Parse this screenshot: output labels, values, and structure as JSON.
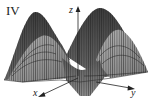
{
  "figure": {
    "panel_label": "IV",
    "type": "3d-surface-plot",
    "axes": {
      "z_label": "z",
      "x_label": "x",
      "y_label": "y"
    },
    "colors": {
      "background": "#ffffff",
      "surface_dark": "#4a4a4a",
      "surface_mid": "#7a7a7a",
      "surface_light": "#a8a8a8",
      "mesh": "#1e1e1e",
      "axis": "#222222"
    }
  }
}
